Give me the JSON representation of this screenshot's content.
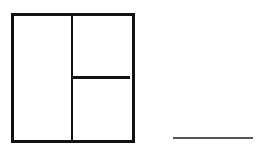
{
  "diagram": {
    "panels": [
      {
        "id": "left",
        "label": ""
      },
      {
        "id": "top-right",
        "label": ""
      },
      {
        "id": "bottom-right",
        "label": ""
      }
    ],
    "colors": {
      "stroke": "#111111",
      "line": "#555555",
      "background": "#ffffff"
    }
  }
}
